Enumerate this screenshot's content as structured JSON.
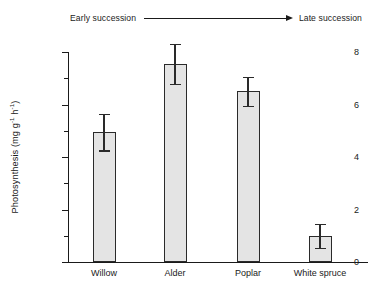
{
  "annotation": {
    "early_label": "Early succession",
    "late_label": "Late succession",
    "arrow_icon": "right-arrow-icon"
  },
  "axis": {
    "y_title_prefix": "Photosynthesis (mg g",
    "y_title_sup1": "-1",
    "y_title_mid": " h",
    "y_title_sup2": "-1",
    "y_title_suffix": ")",
    "y_ticks": [
      "0",
      "2",
      "4",
      "6",
      "8"
    ]
  },
  "chart_data": {
    "type": "bar",
    "title": "",
    "subtitle": "",
    "xlabel": "",
    "ylabel": "Photosynthesis (mg g-1 h-1)",
    "ylim": [
      0,
      8
    ],
    "y_major_ticks": [
      0,
      2,
      4,
      6,
      8
    ],
    "y_minor_ticks": [
      1,
      3,
      5,
      7
    ],
    "grid": false,
    "legend": false,
    "categories": [
      "Willow",
      "Alder",
      "Poplar",
      "White spruce"
    ],
    "values": [
      4.95,
      7.55,
      6.5,
      1.0
    ],
    "errors": [
      0.7,
      0.75,
      0.55,
      0.45
    ],
    "error_type": "standard error",
    "annotation": "Early succession → Late succession",
    "bar_fill_color": "#e4e4e4",
    "bar_edge_color": "#2a2a2a",
    "axis_color": "#1a1a1a"
  }
}
